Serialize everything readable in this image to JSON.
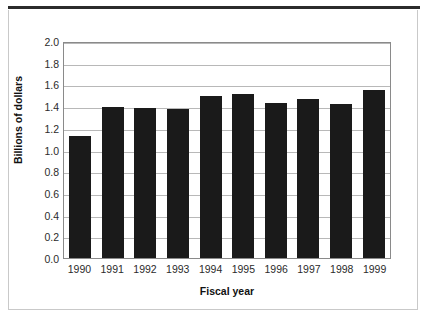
{
  "chart_data": {
    "type": "bar",
    "title": "",
    "subtitle": "",
    "xlabel": "Fiscal year",
    "ylabel": "Billions of dollars",
    "categories": [
      "1990",
      "1991",
      "1992",
      "1993",
      "1994",
      "1995",
      "1996",
      "1997",
      "1998",
      "1999"
    ],
    "values": [
      1.12,
      1.39,
      1.385,
      1.37,
      1.49,
      1.51,
      1.43,
      1.47,
      1.42,
      1.55
    ],
    "series": [
      {
        "name": "Billions of dollars",
        "values": [
          1.12,
          1.39,
          1.385,
          1.37,
          1.49,
          1.51,
          1.43,
          1.47,
          1.42,
          1.55
        ]
      }
    ],
    "ylim": [
      0.0,
      2.0
    ],
    "ytick_labels": [
      "2.0",
      "1.8",
      "1.6",
      "1.4",
      "1.2",
      "1.0",
      "0.8",
      "0.6",
      "0.4",
      "0.2",
      "0.0"
    ],
    "ytick_values": [
      2.0,
      1.8,
      1.6,
      1.4,
      1.2,
      1.0,
      0.8,
      0.6,
      0.4,
      0.2,
      0.0
    ],
    "grid": true,
    "grid_axis": "y",
    "legend": false,
    "legend_position": "none",
    "bar_color": "#1a1a1a",
    "gridline_color": "#b8b8b8",
    "plot_border_color": "#8a8a8a",
    "frame_color": "#c9c9c9",
    "rule_color": "#2b2b2b",
    "background_color": "#ffffff"
  }
}
